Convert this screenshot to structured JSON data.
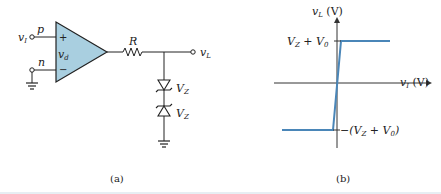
{
  "circuit": {
    "input_label": "v",
    "input_sub": "I",
    "p_label": "p",
    "n_label": "n",
    "plus_sign": "+",
    "minus_sign": "−",
    "vd_label": "v",
    "vd_sub": "d",
    "resistor_label": "R",
    "output_label": "v",
    "output_sub": "L",
    "zener1_label": "V",
    "zener1_sub": "Z",
    "zener2_label": "V",
    "zener2_sub": "Z",
    "caption": "(a)",
    "opamp_fill": "#a9cfe0"
  },
  "graph": {
    "y_axis_label": "v",
    "y_axis_sub": "L",
    "y_axis_unit": " (V)",
    "x_axis_label": "v",
    "x_axis_sub": "I",
    "x_axis_unit": " (V)",
    "upper_level_label_a": "V",
    "upper_level_sub_a": "Z",
    "upper_level_label_b": " + V",
    "upper_level_sub_b": "0",
    "lower_level_label_a": "−(V",
    "lower_level_sub_a": "Z",
    "lower_level_label_b": " + V",
    "lower_level_sub_b": "0",
    "lower_level_label_c": ")",
    "caption": "(b)",
    "curve_color": "#4a86b8"
  }
}
